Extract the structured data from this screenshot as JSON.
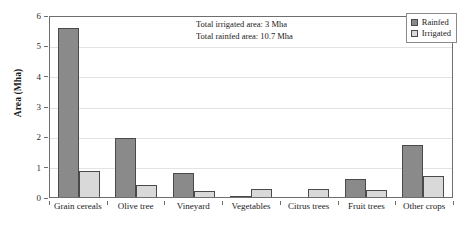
{
  "chart_data": {
    "type": "bar",
    "title": "",
    "xlabel": "",
    "ylabel": "Area (Mha)",
    "ylim": [
      0,
      6
    ],
    "yticks": [
      0,
      1,
      2,
      3,
      4,
      5,
      6
    ],
    "ytick_labels": [
      "0",
      "1",
      "2",
      "3",
      "4",
      "5",
      "6"
    ],
    "grid": true,
    "legend_position": "top-right",
    "categories": [
      "Grain cereals",
      "Olive tree",
      "Vineyard",
      "Vegetables",
      "Citrus trees",
      "Fruit trees",
      "Other crops"
    ],
    "series": [
      {
        "name": "Rainfed",
        "color": "#8a8a8a",
        "values": [
          5.58,
          1.95,
          0.8,
          0.03,
          0.0,
          0.6,
          1.7
        ]
      },
      {
        "name": "Irrigated",
        "color": "#d9d9d9",
        "values": [
          0.85,
          0.38,
          0.2,
          0.25,
          0.27,
          0.22,
          0.7
        ]
      }
    ],
    "annotations": [
      "Total irrigated area: 3 Mha",
      "Total rainfed area: 10.7 Mha"
    ]
  },
  "legend": {
    "items": [
      {
        "label": "Rainfed"
      },
      {
        "label": "Irrigated"
      }
    ]
  }
}
